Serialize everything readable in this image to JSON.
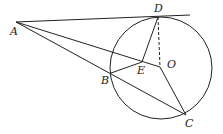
{
  "diagram": {
    "type": "geometry",
    "labels": {
      "A": "A",
      "B": "B",
      "C": "C",
      "D": "D",
      "E": "E",
      "O": "O"
    },
    "points": {
      "A": [
        16,
        22
      ],
      "B": [
        111,
        73
      ],
      "C": [
        186,
        115
      ],
      "D": [
        158,
        17
      ],
      "E": [
        142,
        62
      ],
      "O": [
        160,
        67
      ]
    },
    "circle": {
      "center": "O",
      "cx": 161,
      "cy": 68,
      "r": 51
    },
    "segments": [
      [
        "A",
        "D"
      ],
      [
        "A",
        "O"
      ],
      [
        "A",
        "C"
      ],
      [
        "D",
        "E"
      ],
      [
        "B",
        "E"
      ],
      [
        "O",
        "C"
      ]
    ],
    "dashed_segments": [
      [
        "D",
        "O"
      ]
    ],
    "tangent_line": {
      "from": "A",
      "through": "D",
      "extends_to": [
        190,
        15
      ]
    }
  }
}
